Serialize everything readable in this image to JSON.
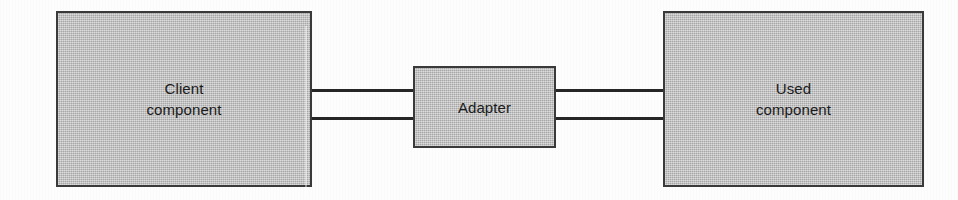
{
  "diagram": {
    "background_color": "#fdfdfd",
    "node_fill_color": "#b9b9b9",
    "node_border_color": "#3a3a3a",
    "connector_color": "#262626",
    "nodes": [
      {
        "id": "client",
        "label": "Client\ncomponent",
        "line1": "Client",
        "line2": "component",
        "x": 56,
        "y": 11,
        "width": 256,
        "height": 176
      },
      {
        "id": "adapter",
        "label": "Adapter",
        "line1": "Adapter",
        "line2": "",
        "x": 413,
        "y": 66,
        "width": 143,
        "height": 82
      },
      {
        "id": "used",
        "label": "Used\ncomponent",
        "line1": "Used",
        "line2": "component",
        "x": 663,
        "y": 11,
        "width": 261,
        "height": 176
      }
    ],
    "connectors": [
      {
        "id": "client-adapter-top",
        "from": "client",
        "to": "adapter",
        "x": 312,
        "y": 89,
        "length": 101
      },
      {
        "id": "client-adapter-bottom",
        "from": "client",
        "to": "adapter",
        "x": 312,
        "y": 117,
        "length": 101
      },
      {
        "id": "adapter-used-top",
        "from": "adapter",
        "to": "used",
        "x": 556,
        "y": 89,
        "length": 107
      },
      {
        "id": "adapter-used-bottom",
        "from": "adapter",
        "to": "used",
        "x": 556,
        "y": 117,
        "length": 107
      }
    ]
  }
}
